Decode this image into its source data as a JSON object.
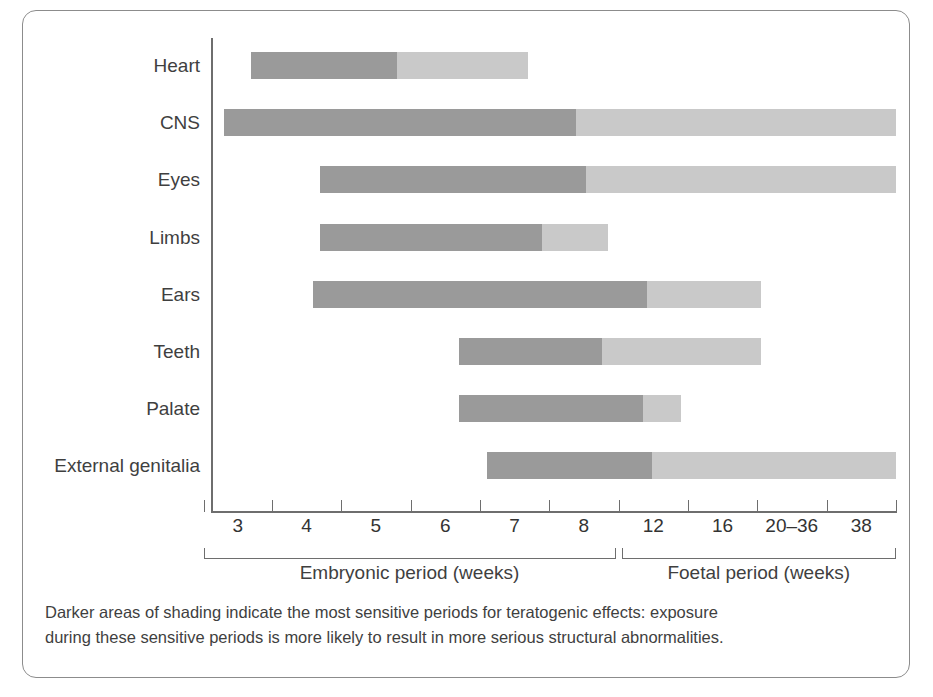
{
  "chart_data": {
    "type": "bar",
    "title": "",
    "subtitle": "",
    "xlabel": "Weeks of gestation",
    "ylabel": "",
    "grid": false,
    "legend_position": "none",
    "orientation": "horizontal",
    "series_names": [
      "Most sensitive period (darker shading)",
      "Less sensitive period (lighter shading)"
    ],
    "colors": {
      "dark": "#9a9a9a",
      "light": "#c9c9c9",
      "axis": "#6e6e6e",
      "text": "#3f3f3f",
      "frame": "#8c8c8c"
    },
    "x_tick_labels": [
      "3",
      "4",
      "5",
      "6",
      "7",
      "8",
      "12",
      "16",
      "20–36",
      "38"
    ],
    "categories": [
      "Heart",
      "CNS",
      "Eyes",
      "Limbs",
      "Ears",
      "Teeth",
      "Palate",
      "External genitalia"
    ],
    "bars": [
      {
        "label": "Heart",
        "start_week": 3.2,
        "dark_end_week": 5.3,
        "end_week": 7.2
      },
      {
        "label": "CNS",
        "start_week": 2.8,
        "dark_end_week": 8.0,
        "end_week": 38.0
      },
      {
        "label": "Eyes",
        "start_week": 4.2,
        "dark_end_week": 8.2,
        "end_week": 38.0
      },
      {
        "label": "Limbs",
        "start_week": 4.2,
        "dark_end_week": 7.4,
        "end_week": 8.6
      },
      {
        "label": "Ears",
        "start_week": 4.1,
        "dark_end_week": 10.9,
        "end_week": 18.6
      },
      {
        "label": "Teeth",
        "start_week": 6.2,
        "dark_end_week": 8.5,
        "end_week": 18.6
      },
      {
        "label": "Palate",
        "start_week": 6.2,
        "dark_end_week": 10.6,
        "end_week": 13.5
      },
      {
        "label": "External genitalia",
        "start_week": 6.6,
        "dark_end_week": 11.3,
        "end_week": 38.0
      }
    ],
    "periods": [
      {
        "label": "Embryonic period (weeks)",
        "from_week": 2.8,
        "to_week": 8.8
      },
      {
        "label": "Foetal period (weeks)",
        "from_week": 8.8,
        "to_week": 38.0
      }
    ]
  },
  "caption": {
    "line1": "Darker areas of shading indicate the most sensitive periods for teratogenic effects: exposure",
    "line2": "during these sensitive periods is more likely to result in more serious structural abnormalities."
  }
}
